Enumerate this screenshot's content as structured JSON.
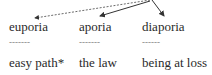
{
  "diagram": {
    "columns": [
      {
        "term": "euporia",
        "separator": "-------",
        "gloss": "easy path*",
        "arrow_style": "dashed"
      },
      {
        "term": "aporia",
        "separator": "-------",
        "gloss": "the law",
        "arrow_style": "solid"
      },
      {
        "term": "diaporia",
        "separator": "------",
        "gloss": "being at loss",
        "arrow_style": "solid"
      }
    ],
    "colors": {
      "text": "#2a2a2a",
      "arrow": "#333333",
      "separator": "#777777",
      "background": "#ffffff"
    }
  }
}
